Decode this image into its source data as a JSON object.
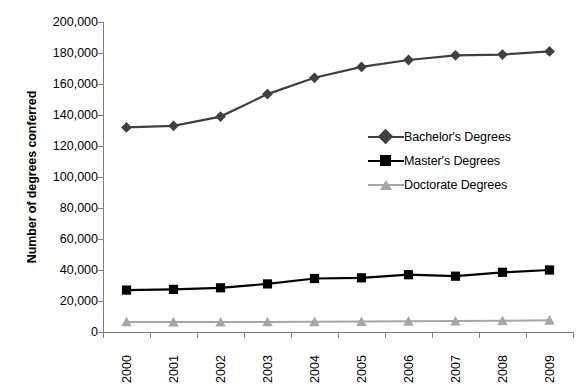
{
  "chart_data": {
    "type": "line",
    "title": "",
    "xlabel": "",
    "ylabel": "Number of degrees conferred",
    "categories": [
      "2000",
      "2001",
      "2002",
      "2003",
      "2004",
      "2005",
      "2006",
      "2007",
      "2008",
      "2009"
    ],
    "x": [
      2000,
      2001,
      2002,
      2003,
      2004,
      2005,
      2006,
      2007,
      2008,
      2009
    ],
    "ylim": [
      0,
      200000
    ],
    "ytick_values": [
      0,
      20000,
      40000,
      60000,
      80000,
      100000,
      120000,
      140000,
      160000,
      180000,
      200000
    ],
    "ytick_labels": [
      "0",
      "20,000",
      "40,000",
      "60,000",
      "80,000",
      "100,000",
      "120,000",
      "140,000",
      "160,000",
      "180,000",
      "200,000"
    ],
    "grid": false,
    "legend_position": "center-right",
    "series": [
      {
        "name": "Bachelor's Degrees",
        "marker": "diamond",
        "color": "#404040",
        "values": [
          132000,
          133000,
          139000,
          153500,
          164000,
          171000,
          175500,
          178500,
          179000,
          181000
        ]
      },
      {
        "name": "Master's Degrees",
        "marker": "square",
        "color": "#000000",
        "values": [
          27000,
          27500,
          28500,
          31000,
          34500,
          35000,
          37000,
          36000,
          38500,
          40000
        ]
      },
      {
        "name": "Doctorate Degrees",
        "marker": "triangle",
        "color": "#a6a6a6",
        "values": [
          6500,
          6400,
          6400,
          6500,
          6600,
          6700,
          6900,
          7000,
          7200,
          7600
        ]
      }
    ]
  },
  "axis": {
    "axis_color": "#7f7f7f"
  },
  "legend": {
    "items": [
      {
        "label": "Bachelor's Degrees"
      },
      {
        "label": "Master's Degrees"
      },
      {
        "label": "Doctorate Degrees"
      }
    ]
  }
}
